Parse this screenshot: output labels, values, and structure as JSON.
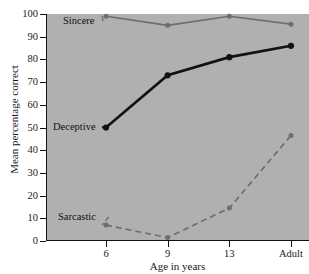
{
  "chart_data": {
    "type": "line",
    "title": "",
    "xlabel": "Age in years",
    "ylabel": "Mean percentage correct",
    "categories": [
      "6",
      "9",
      "13",
      "Adult"
    ],
    "ylim": [
      0,
      100
    ],
    "yticks": [
      0,
      10,
      20,
      30,
      40,
      50,
      60,
      70,
      80,
      90,
      100
    ],
    "grid": false,
    "legend_position": "inline-labels",
    "series": [
      {
        "name": "Sincere",
        "values": [
          99,
          95,
          99,
          95.5
        ],
        "color": "#6e6e6e",
        "style": "solid",
        "marker": "circle"
      },
      {
        "name": "Deceptive",
        "values": [
          50,
          73,
          81,
          86
        ],
        "color": "#111111",
        "style": "solid",
        "marker": "circle"
      },
      {
        "name": "Sarcastic",
        "values": [
          7,
          1.5,
          14.5,
          46.5
        ],
        "color": "#6e6e6e",
        "style": "dashed",
        "marker": "circle"
      }
    ],
    "annotations": [
      {
        "text": "Sincere",
        "series": "Sincere"
      },
      {
        "text": "Deceptive",
        "series": "Deceptive"
      },
      {
        "text": "Sarcastic",
        "series": "Sarcastic"
      }
    ],
    "background_color": "#b0b0b0"
  }
}
